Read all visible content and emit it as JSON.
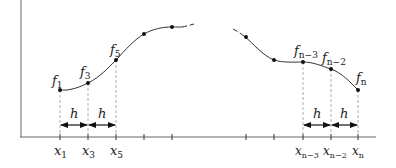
{
  "diagram": {
    "spacing_label": "h",
    "left_points": [
      {
        "x": 60,
        "y": 90,
        "f_label": "f",
        "f_sub": "1",
        "x_label": "x",
        "x_sub": "1"
      },
      {
        "x": 88,
        "y": 83,
        "f_label": "f",
        "f_sub": "3",
        "x_label": "x",
        "x_sub": "3"
      },
      {
        "x": 116,
        "y": 60,
        "f_label": "f",
        "f_sub": "5",
        "x_label": "x",
        "x_sub": "5"
      },
      {
        "x": 144,
        "y": 34
      },
      {
        "x": 172,
        "y": 27
      }
    ],
    "right_points": [
      {
        "x": 246,
        "y": 37
      },
      {
        "x": 274,
        "y": 60
      },
      {
        "x": 303,
        "y": 62,
        "f_label": "f",
        "f_sub": "n−3",
        "x_label": "x",
        "x_sub": "n−3"
      },
      {
        "x": 331,
        "y": 69,
        "f_label": "f",
        "f_sub": "n−2",
        "x_label": "x",
        "x_sub": "n−2"
      },
      {
        "x": 358,
        "y": 90,
        "f_label": "f",
        "f_sub": "n",
        "x_label": "x",
        "x_sub": "n"
      }
    ],
    "labels": {
      "f1": "f",
      "f1_sub": "1",
      "f3": "f",
      "f3_sub": "3",
      "f5": "f",
      "f5_sub": "5",
      "fn3": "f",
      "fn3_sub": "n−3",
      "fn2": "f",
      "fn2_sub": "n−2",
      "fn": "f",
      "fn_sub": "n",
      "x1": "x",
      "x1_sub": "1",
      "x3": "x",
      "x3_sub": "3",
      "x5": "x",
      "x5_sub": "5",
      "xn3": "x",
      "xn3_sub": "n−3",
      "xn2": "x",
      "xn2_sub": "n−2",
      "xn": "x",
      "xn_sub": "n",
      "h1": "h",
      "h2": "h",
      "h3": "h",
      "h4": "h"
    },
    "colors": {
      "line": "#333333",
      "axis": "#555555",
      "dash": "#888888"
    }
  }
}
